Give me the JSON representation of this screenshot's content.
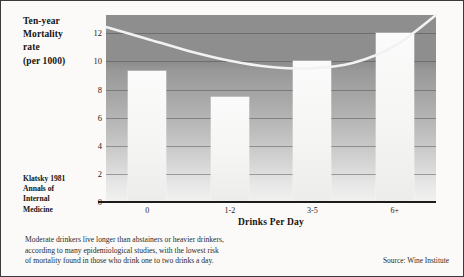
{
  "chart_data": {
    "type": "bar",
    "title_lines": [
      "Ten-year",
      "Mortality",
      "rate",
      "(per 1000)"
    ],
    "xlabel": "Drinks Per Day",
    "ylabel": "Ten-year Mortality rate (per 1000)",
    "categories": [
      "0",
      "1-2",
      "3-5",
      "6+"
    ],
    "values": [
      9.3,
      7.5,
      10.0,
      12.0
    ],
    "ylim": [
      0,
      13.3
    ],
    "yticks": [
      0,
      2,
      4,
      6,
      8,
      10,
      12
    ],
    "ytick_labels": [
      "0",
      "2",
      "4",
      "6",
      "8",
      "10",
      "12"
    ],
    "grid": true,
    "legend": "none",
    "series": [
      {
        "name": "Ten-year mortality rate",
        "type": "bar",
        "values": [
          9.3,
          7.5,
          10.0,
          12.0
        ]
      },
      {
        "name": "Fitted U-shaped trend",
        "type": "line",
        "x": [
          0.0,
          0.5,
          1.0,
          1.5,
          2.0,
          2.5,
          3.0,
          3.5,
          4.0
        ],
        "values": [
          12.45,
          11.6,
          10.75,
          10.05,
          9.6,
          9.5,
          9.9,
          11.1,
          13.3
        ]
      }
    ],
    "colors": {
      "bar_fill": "#fbfbfb",
      "curve": "#f2f2f2",
      "plot_background_top": "#8e8e8e",
      "plot_background_bottom": "#f2f1ef",
      "gridline": "#464646",
      "axis": "#1c1c1c",
      "page_background": "#fbfaf8",
      "text": "#141414"
    }
  },
  "citation": {
    "lines": [
      "Klatsky 1981",
      "Annals of",
      "Internal",
      "Medicine"
    ]
  },
  "caption": {
    "lines": [
      "Moderate drinkers live longer than abstainers or heavier drinkers,",
      "according to many epidemiological studies, with the lowest risk",
      "of mortality found in those who drink one to two drinks a day."
    ]
  },
  "source": {
    "text": "Source: Wine Institute"
  }
}
